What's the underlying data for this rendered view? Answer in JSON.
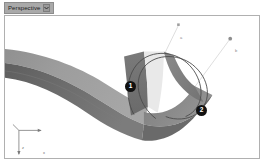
{
  "window": {
    "background_color": "#ffffff",
    "viewport_border_color": "#b0b0b0"
  },
  "tab": {
    "label": "Perspective",
    "caret_icon": "chevron-down-icon",
    "background_color": "#a9a9a9",
    "text_color": "#1c1c1c"
  },
  "viewport": {
    "name": "perspective-viewport",
    "background_color": "#ffffff"
  },
  "annotations": [
    {
      "id": "1",
      "label": "1",
      "x": 120,
      "y": 65
    },
    {
      "id": "2",
      "label": "2",
      "x": 191,
      "y": 89
    }
  ],
  "endpoint_labels": [
    {
      "id": "a",
      "label": "a",
      "x": 175,
      "y": 20
    },
    {
      "id": "b",
      "label": "b",
      "x": 230,
      "y": 33
    }
  ],
  "axis_gizmo": {
    "name": "axis-gizmo",
    "x_label": "x",
    "y_label": "y",
    "z_label": "z",
    "color": "#6e6e6e"
  },
  "geometry": {
    "surface_light_color": "#9a9a9a",
    "surface_mid_color": "#8a8a8a",
    "surface_dark_color": "#6f6f6f",
    "surface_darkest_color": "#5e5e5e",
    "curve_color": "#4a4a4a",
    "leader_line_color": "#c8c8c8"
  }
}
